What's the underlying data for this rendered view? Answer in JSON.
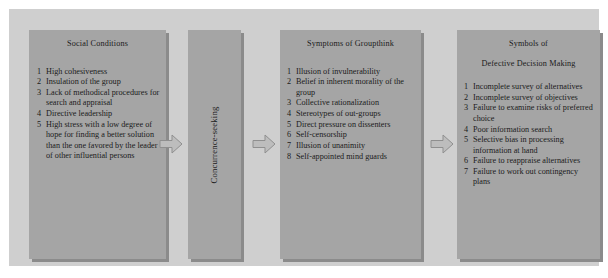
{
  "diagram": {
    "type": "process-flow",
    "colors": {
      "page_background": "#ffffff",
      "canvas_background": "#cfcfcf",
      "box_fill": "#a5a5a5",
      "box_shadow": "#8b8b8b",
      "arrow_fill": "#bdbdbd",
      "arrow_stroke": "#8f8f8f",
      "text": "#1b1b1b"
    }
  },
  "boxes": {
    "social_conditions": {
      "title": "Social Conditions",
      "items": [
        {
          "num": "1",
          "text": "High cohesiveness"
        },
        {
          "num": "2",
          "text": "Insulation of the group"
        },
        {
          "num": "3",
          "text": "Lack of methodical procedures for search and appraisal"
        },
        {
          "num": "4",
          "text": "Directive leadership"
        },
        {
          "num": "5",
          "text": "High stress with a low degree of hope for finding a better solution than the one favored by the leader of other influential persons"
        }
      ]
    },
    "concurrence": {
      "label": "Concurrence-seeking"
    },
    "symptoms_of_groupthink": {
      "title": "Symptoms of Groupthink",
      "items": [
        {
          "num": "1",
          "text": "Illusion of invulnerability"
        },
        {
          "num": "2",
          "text": "Belief in inherent morality of the group"
        },
        {
          "num": "3",
          "text": "Collective rationalization"
        },
        {
          "num": "4",
          "text": "Stereotypes of out-groups"
        },
        {
          "num": "5",
          "text": "Direct pressure on dissenters"
        },
        {
          "num": "6",
          "text": "Self-censorship"
        },
        {
          "num": "7",
          "text": "Illusion of unanimity"
        },
        {
          "num": "8",
          "text": "Self-appointed mind guards"
        }
      ]
    },
    "defective_decision_making": {
      "title_line1": "Symbols of",
      "title_line2": "Defective Decision Making",
      "items": [
        {
          "num": "1",
          "text": "Incomplete survey of alternatives"
        },
        {
          "num": "2",
          "text": "Incomplete survey of objectives"
        },
        {
          "num": "3",
          "text": "Failure to examine risks of  preferred choice"
        },
        {
          "num": "4",
          "text": "Poor information search"
        },
        {
          "num": "5",
          "text": "Selective bias in processing information at hand"
        },
        {
          "num": "6",
          "text": "Failure to reappraise alternatives"
        },
        {
          "num": "7",
          "text": "Failure to work out contingency plans"
        }
      ]
    }
  },
  "arrows": [
    {
      "name": "arrow-social-to-concurrence",
      "direction": "right"
    },
    {
      "name": "arrow-concurrence-to-symptoms",
      "direction": "right"
    },
    {
      "name": "arrow-symptoms-to-defective",
      "direction": "right"
    }
  ]
}
